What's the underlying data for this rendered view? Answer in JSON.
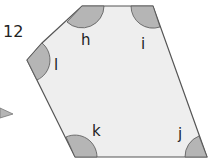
{
  "diagram": {
    "question_number": "12",
    "shape": "hexagon",
    "fill_color": "#eeeeee",
    "stroke_color": "#555555",
    "angle_marker_color": "#b5b5b5",
    "angles": [
      {
        "label": "h"
      },
      {
        "label": "i"
      },
      {
        "label": "j"
      },
      {
        "label": "k"
      },
      {
        "label": "l"
      }
    ]
  }
}
